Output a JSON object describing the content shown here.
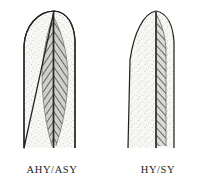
{
  "figure": {
    "type": "scientific-illustration",
    "background_color": "#ffffff",
    "ink_color": "#1c1c1c",
    "panel_count": 2
  },
  "panels": [
    {
      "id": "left",
      "label": "AHY/ASY",
      "feather_name": "adult-feather",
      "tip_shape": "broad-rounded",
      "outline_color": "#2a2a2a",
      "vane_fill": "stippled",
      "vane_color": "#f4f4f1",
      "hatch_color": "#4a4a4a",
      "hatch_region": "lance-shaped-around-shaft",
      "hatch_region_description": "dark chevron-hatched leaf shape tapering at both ends, centered on the rachis",
      "shaft_color": "#2b2b2b"
    },
    {
      "id": "right",
      "label": "HY/SY",
      "feather_name": "juvenile-feather",
      "tip_shape": "narrow-pointed",
      "outline_color": "#2a2a2a",
      "vane_fill": "stippled",
      "vane_color": "#f4f4f1",
      "hatch_color": "#4a4a4a",
      "hatch_region": "narrow-strip-right-of-shaft",
      "hatch_region_description": "narrow uniform-width diagonally hatched band on the trailing side of the rachis",
      "shaft_color": "#2b2b2b"
    }
  ]
}
